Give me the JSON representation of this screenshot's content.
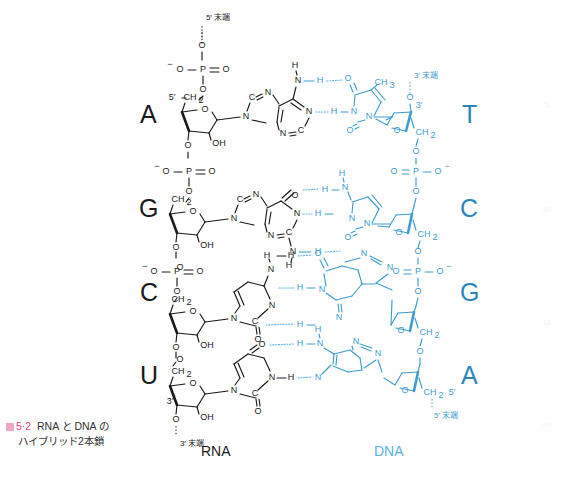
{
  "figure": {
    "caption_marker": "図",
    "caption_number": "5·2",
    "caption_line1": "RNA と DNA の",
    "caption_line2": "ハイブリッド2本鎖",
    "colors": {
      "rna_black": "#1a1a1a",
      "dna_blue": "#3f9cd0",
      "dna_blue_text": "#2e86b8",
      "hbond_blue": "#5bb4e5",
      "caption_pink": "#e0457b",
      "background": "#ffffff"
    }
  },
  "strands": {
    "rna": {
      "label": "RNA",
      "five_prime_end": "5′ 末端",
      "three_prime_end": "3′ 末端",
      "direction": "5′ top to 3′ bottom",
      "bases": [
        "A",
        "G",
        "C",
        "U"
      ],
      "sugar": "ribose",
      "sugar_hydroxyl": "OH"
    },
    "dna": {
      "label": "DNA",
      "three_prime_end": "3′ 末端",
      "five_prime_end": "5′ 末端",
      "direction": "3′ top to 5′ bottom",
      "bases": [
        "T",
        "C",
        "G",
        "A"
      ],
      "sugar": "deoxyribose"
    }
  },
  "base_pairs": [
    {
      "rna": "A",
      "dna": "T",
      "hydrogen_bonds": 2
    },
    {
      "rna": "G",
      "dna": "C",
      "hydrogen_bonds": 3
    },
    {
      "rna": "C",
      "dna": "G",
      "hydrogen_bonds": 3
    },
    {
      "rna": "U",
      "dna": "A",
      "hydrogen_bonds": 2
    }
  ],
  "atom_labels": {
    "phosphorus": "P",
    "oxygen": "O",
    "nitrogen": "N",
    "hydrogen": "H",
    "hydroxyl": "OH",
    "methylene": "CH",
    "methyl": "CH",
    "sub2": "2",
    "sub3": "3",
    "minus": "−",
    "carbon5": "5′",
    "carbon3": "3′"
  },
  "margin_numbers": [
    "5",
    "10",
    "15",
    "20"
  ]
}
